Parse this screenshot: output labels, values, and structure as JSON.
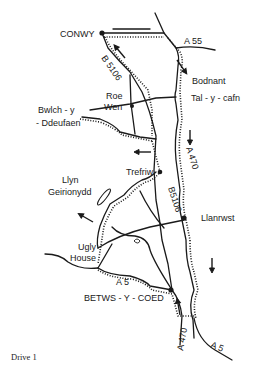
{
  "caption": "Drive 1",
  "places": {
    "conwy": "CONWY",
    "bodnant": "Bodnant",
    "tal_y_cafn": "Tal - y - cafn",
    "roe": "Roe",
    "wen": "Wen",
    "bwlch_1": "Bwlch - y",
    "bwlch_2": "- Ddeufaen",
    "trefriw": "Trefriw",
    "llyn": "Llyn",
    "geirionydd": "Geirionydd",
    "llanrwst": "Llanrwst",
    "ugly": "Ugly",
    "house": "House",
    "betws": "BETWS - Y - COED"
  },
  "roads": {
    "a55": "A 55",
    "b5106_north": "B 5106",
    "b5106_south": "B5106",
    "a470_north": "A 470",
    "a470_south": "A 470",
    "a5_west": "A 5",
    "a5_east": "A 5"
  },
  "colors": {
    "ink": "#1a1a1a",
    "paper": "#ffffff"
  }
}
